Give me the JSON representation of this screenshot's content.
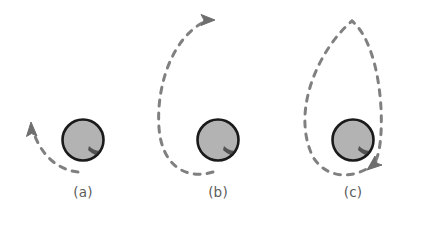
{
  "figure": {
    "type": "diagram",
    "title": "",
    "background_color": "#ffffff",
    "width": 430,
    "height": 225
  },
  "style": {
    "sphere_fill": "#b3b3b3",
    "sphere_outline": "#1a1a1a",
    "sphere_shadow": "#141414",
    "dash_color": "#808080",
    "arrow_color": "#6e6e6e",
    "label_color": "#5b5b5b"
  },
  "panels": [
    {
      "id": "a",
      "label": "(a)",
      "sphere": {
        "cx": 83,
        "cy": 140,
        "r": 21
      },
      "path_name": "short-dashed-arc",
      "path_description": "short dashed arc curving up and to the left away from the sphere",
      "arrow_name": "arrow-up-left",
      "arrow_direction": "up-left",
      "arrow_x": 31,
      "arrow_y": 125
    },
    {
      "id": "b",
      "label": "(b)",
      "sphere": {
        "cx": 218,
        "cy": 140,
        "r": 21
      },
      "path_name": "open-dashed-loop",
      "path_description": "large open dashed loop passing below and around the left of the sphere and rising to the top",
      "arrow_name": "arrow-right",
      "arrow_direction": "right",
      "arrow_x": 208,
      "arrow_y": 20
    },
    {
      "id": "c",
      "label": "(c)",
      "sphere": {
        "cx": 353,
        "cy": 140,
        "r": 21
      },
      "path_name": "closed-dashed-ellipse",
      "path_description": "closed dashed elliptical loop surrounding and extending above the sphere",
      "arrow_name": "arrow-down-left",
      "arrow_direction": "down-left",
      "arrow_x": 372,
      "arrow_y": 163
    }
  ]
}
